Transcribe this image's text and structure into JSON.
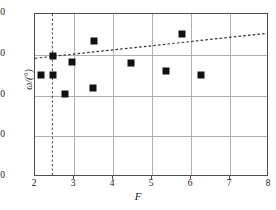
{
  "chart_data": {
    "type": "scatter",
    "title": "",
    "xlabel": "F",
    "ylabel": "ω/(°)",
    "xlim": [
      2,
      8
    ],
    "ylim": [
      0,
      40
    ],
    "grid": true,
    "legend": "none",
    "xticks": [
      2,
      3,
      4,
      5,
      6,
      7,
      8
    ],
    "xtick_labels": [
      "2",
      "3",
      "4",
      "5",
      "6",
      "7",
      "8"
    ],
    "yticks": [
      0,
      10,
      20,
      30,
      40
    ],
    "ytick_labels": [
      "0",
      "10",
      "20",
      "30",
      "40"
    ],
    "series": [
      {
        "name": "measurements",
        "marker": "filled-square",
        "color": "#111111",
        "points": [
          {
            "x": 2.15,
            "y": 25.1
          },
          {
            "x": 2.45,
            "y": 25.1
          },
          {
            "x": 2.45,
            "y": 29.6
          },
          {
            "x": 2.78,
            "y": 20.3
          },
          {
            "x": 2.95,
            "y": 28.2
          },
          {
            "x": 3.48,
            "y": 21.9
          },
          {
            "x": 3.52,
            "y": 33.3
          },
          {
            "x": 4.45,
            "y": 28.0
          },
          {
            "x": 5.35,
            "y": 26.1
          },
          {
            "x": 5.77,
            "y": 35.2
          },
          {
            "x": 6.25,
            "y": 25.0
          }
        ]
      }
    ],
    "annotations": [
      {
        "name": "trend-line",
        "type": "dashed-line",
        "color": "#333333",
        "x0": 2.0,
        "y0": 29.0,
        "x1": 8.0,
        "y1": 35.2
      },
      {
        "name": "threshold-line",
        "type": "dashed-vertical-line",
        "color": "#555555",
        "x": 2.45,
        "y0": 0,
        "y1": 40
      }
    ]
  }
}
